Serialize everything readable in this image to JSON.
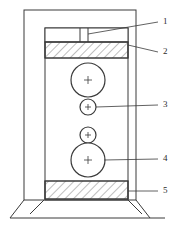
{
  "figure": {
    "title": "",
    "type": "technical-line-drawing",
    "background_color": "#ffffff",
    "line_color": "#3a3a3a",
    "hatch_color": "#6e6e6e",
    "label_color": "#2b2b2b"
  },
  "callouts": [
    {
      "id": "1",
      "label": "1",
      "x": 164,
      "y": 18,
      "leader_from_x": 158,
      "leader_from_y": 22,
      "leader_to_x": 88,
      "leader_to_y": 34
    },
    {
      "id": "2",
      "label": "2",
      "x": 164,
      "y": 48,
      "leader_from_x": 158,
      "leader_from_y": 52,
      "leader_to_x": 128,
      "leader_to_y": 45
    },
    {
      "id": "3",
      "label": "3",
      "x": 164,
      "y": 101,
      "leader_from_x": 158,
      "leader_from_y": 105,
      "leader_to_x": 96,
      "leader_to_y": 107
    },
    {
      "id": "4",
      "label": "4",
      "x": 164,
      "y": 155,
      "leader_from_x": 158,
      "leader_from_y": 159,
      "leader_to_x": 104,
      "leader_to_y": 160
    },
    {
      "id": "5",
      "label": "5",
      "x": 164,
      "y": 187,
      "leader_from_x": 158,
      "leader_from_y": 191,
      "leader_to_x": 128,
      "leader_to_y": 191
    }
  ],
  "parts": {
    "outer_frame": {
      "name": "machine-frame",
      "x": 24,
      "y": 10,
      "width": 112,
      "height": 190
    },
    "inner_column": {
      "name": "inner-column",
      "x": 45,
      "y": 28,
      "width": 83,
      "height": 172
    },
    "top_cap": {
      "name": "top-cap-block",
      "x": 45,
      "y": 28,
      "width": 83,
      "height": 14,
      "divider_x": [
        80,
        88
      ],
      "slot_label": "1"
    },
    "upper_platen": {
      "name": "upper-hatched-platen",
      "x": 45,
      "y": 42,
      "width": 83,
      "height": 16,
      "hatched": true,
      "label": "2"
    },
    "lower_platen": {
      "name": "lower-hatched-platen",
      "x": 45,
      "y": 181,
      "width": 83,
      "height": 18,
      "hatched": true,
      "label": "5"
    },
    "base": {
      "name": "machine-base",
      "ground_y": 218,
      "left_x": 10,
      "right_x": 165
    }
  },
  "rollers": [
    {
      "name": "upper-large-roller",
      "cx": 88,
      "cy": 80,
      "r": 17,
      "center_mark": "+"
    },
    {
      "name": "upper-small-roller",
      "cx": 88,
      "cy": 107,
      "r": 8,
      "center_mark": "+",
      "label": "3"
    },
    {
      "name": "lower-small-roller",
      "cx": 88,
      "cy": 135,
      "r": 8,
      "center_mark": "+"
    },
    {
      "name": "lower-large-roller",
      "cx": 88,
      "cy": 160,
      "r": 17,
      "center_mark": "+",
      "label": "4"
    }
  ]
}
